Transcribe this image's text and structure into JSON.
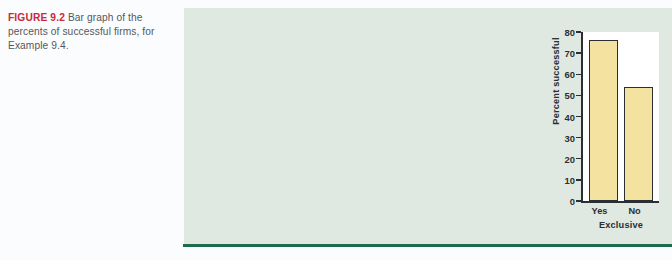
{
  "caption": {
    "figure_label": "FIGURE 9.2",
    "text": "Bar graph of the percents of successful firms, for Example 9.4."
  },
  "colors": {
    "figure_label": "#c8283c",
    "caption_text": "#53585e",
    "panel_background": "#dfe9e1",
    "panel_rule": "#1d6b49",
    "plot_background": "#ffffff",
    "bar_fill": "#f4e2a1",
    "bar_outline": "#2b2f33",
    "axis": "#2b2f33"
  },
  "chart_data": {
    "type": "bar",
    "title": "",
    "categories": [
      "Yes",
      "No"
    ],
    "values": [
      76,
      54
    ],
    "xlabel": "Exclusive",
    "ylabel": "Percent successful",
    "ylim": [
      0,
      80
    ],
    "yticks": [
      0,
      10,
      20,
      30,
      40,
      50,
      60,
      70,
      80
    ],
    "ytick_labels": [
      "0",
      "10",
      "20",
      "30",
      "40",
      "50",
      "60",
      "70",
      "80"
    ],
    "grid": false,
    "legend": false
  }
}
